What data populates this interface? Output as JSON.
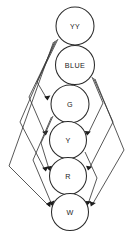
{
  "diagram": {
    "type": "directed-acyclic-graph",
    "background_color": "#ffffff",
    "node_fill_color": "#ffffff",
    "node_stroke_color": "#2b2b2b",
    "edge_color": "#3a3a3a",
    "label_color": "#1a1a1a",
    "node_count": 6,
    "edge_count": 15
  },
  "nodes": [
    {
      "id": "YY",
      "label": "YY",
      "cx": 75,
      "cy": 26,
      "r": 19,
      "font_size": 7.0,
      "rank": 1
    },
    {
      "id": "BLUE",
      "label": "BLUE",
      "cx": 75,
      "cy": 65,
      "r": 19.5,
      "font_size": 7.2,
      "rank": 2
    },
    {
      "id": "G",
      "label": "G",
      "cx": 70,
      "cy": 104,
      "r": 19,
      "font_size": 7.2,
      "rank": 3
    },
    {
      "id": "Y",
      "label": "Y",
      "cx": 68,
      "cy": 140,
      "r": 18.5,
      "font_size": 7.2,
      "rank": 4
    },
    {
      "id": "R",
      "label": "R",
      "cx": 68,
      "cy": 176,
      "r": 18.5,
      "font_size": 7.2,
      "rank": 5
    },
    {
      "id": "W",
      "label": "W",
      "cx": 70,
      "cy": 212,
      "r": 18.5,
      "font_size": 7.2,
      "rank": 6
    }
  ],
  "edges": [
    {
      "from": "YY",
      "to": "BLUE",
      "kind": "direct",
      "side": "center"
    },
    {
      "from": "BLUE",
      "to": "G",
      "kind": "direct",
      "side": "center"
    },
    {
      "from": "G",
      "to": "Y",
      "kind": "direct",
      "side": "center"
    },
    {
      "from": "Y",
      "to": "R",
      "kind": "direct",
      "side": "center"
    },
    {
      "from": "R",
      "to": "W",
      "kind": "direct",
      "side": "center"
    },
    {
      "from": "YY",
      "to": "G",
      "kind": "skip",
      "side": "left"
    },
    {
      "from": "YY",
      "to": "Y",
      "kind": "skip",
      "side": "left"
    },
    {
      "from": "YY",
      "to": "R",
      "kind": "skip",
      "side": "left"
    },
    {
      "from": "YY",
      "to": "W",
      "kind": "skip",
      "side": "left"
    },
    {
      "from": "BLUE",
      "to": "Y",
      "kind": "skip",
      "side": "right"
    },
    {
      "from": "BLUE",
      "to": "R",
      "kind": "skip",
      "side": "right"
    },
    {
      "from": "BLUE",
      "to": "W",
      "kind": "skip",
      "side": "right"
    },
    {
      "from": "G",
      "to": "R",
      "kind": "skip",
      "side": "left"
    },
    {
      "from": "G",
      "to": "W",
      "kind": "skip",
      "side": "left"
    },
    {
      "from": "Y",
      "to": "W",
      "kind": "skip",
      "side": "right"
    }
  ]
}
